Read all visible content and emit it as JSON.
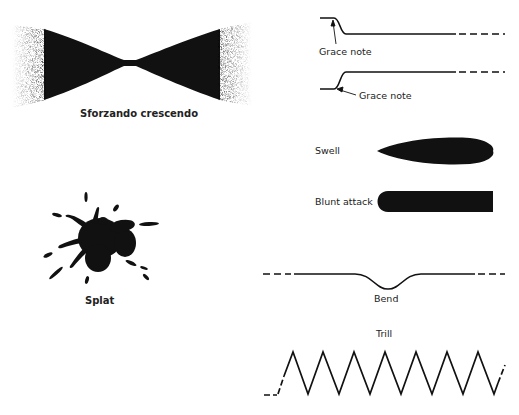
{
  "figure": {
    "items": [
      {
        "id": "sforzando",
        "label": "Sforzando crescendo"
      },
      {
        "id": "grace1",
        "label": "Grace note"
      },
      {
        "id": "grace2",
        "label": "Grace note"
      },
      {
        "id": "swell",
        "label": "Swell"
      },
      {
        "id": "blunt",
        "label": "Blunt attack"
      },
      {
        "id": "splat",
        "label": "Splat"
      },
      {
        "id": "bend",
        "label": "Bend"
      },
      {
        "id": "trill",
        "label": "Trill"
      }
    ],
    "colors": {
      "ink": "#111111",
      "background": "#ffffff"
    }
  }
}
